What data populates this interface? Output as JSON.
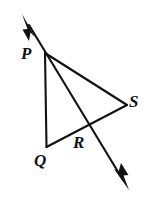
{
  "figure": {
    "background_color": "#ffffff",
    "stroke_color": "#111111",
    "stroke_width": 2,
    "canvas": {
      "width": 156,
      "height": 201
    },
    "labels": {
      "P": "P",
      "Q": "Q",
      "R": "R",
      "S": "S"
    },
    "points": {
      "P": {
        "x": 46,
        "y": 53
      },
      "Q": {
        "x": 46,
        "y": 147
      },
      "R": {
        "x": 85,
        "y": 129
      },
      "S": {
        "x": 127,
        "y": 105
      },
      "arrow_upper_tip": {
        "x": 22,
        "y": 14
      },
      "arrow_lower_tip": {
        "x": 129,
        "y": 190
      }
    },
    "segments": [
      {
        "name": "double-arrow-line-through-P-and-R",
        "from": "arrow_upper_tip",
        "to": "arrow_lower_tip",
        "arrow_start": true,
        "arrow_end": true
      },
      {
        "name": "segment-P-Q",
        "from": "P",
        "to": "Q",
        "arrow_start": false,
        "arrow_end": false
      },
      {
        "name": "segment-P-S",
        "from": "P",
        "to": "S",
        "arrow_start": false,
        "arrow_end": false
      },
      {
        "name": "segment-Q-S",
        "from": "Q",
        "to": "S",
        "arrow_start": false,
        "arrow_end": false
      }
    ]
  }
}
